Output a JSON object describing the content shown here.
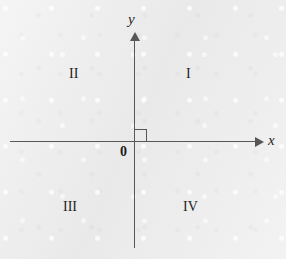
{
  "figure": {
    "type": "cartesian-coordinate-plane",
    "background_color": "#ececec",
    "stroke_color": "#575757",
    "text_color": "#1f1f1f"
  },
  "axes": {
    "x": {
      "label": "x",
      "arrow_direction": "right",
      "position_y": 141
    },
    "y": {
      "label": "y",
      "arrow_direction": "up",
      "position_x": 134
    }
  },
  "origin": {
    "label": "0",
    "x": 135,
    "y": 141
  },
  "right_angle_marker": {
    "name": "right-angle-square",
    "quadrant": "I",
    "size": 12
  },
  "quadrants": [
    {
      "id": "i",
      "label": "I",
      "name": "quadrant-i"
    },
    {
      "id": "ii",
      "label": "II",
      "name": "quadrant-ii"
    },
    {
      "id": "iii",
      "label": "III",
      "name": "quadrant-iii"
    },
    {
      "id": "iv",
      "label": "IV",
      "name": "quadrant-iv"
    }
  ],
  "chart_data": {
    "type": "scatter",
    "title": "",
    "subtitle": "",
    "xlabel": "x",
    "ylabel": "y",
    "xlim": [
      -1,
      1
    ],
    "ylim": [
      -1,
      1
    ],
    "grid": false,
    "legend": null,
    "x": [],
    "y": [],
    "series": [],
    "annotations": [
      {
        "text": "I",
        "x": 0.45,
        "y": 0.55
      },
      {
        "text": "II",
        "x": -0.48,
        "y": 0.55
      },
      {
        "text": "III",
        "x": -0.52,
        "y": -0.52
      },
      {
        "text": "IV",
        "x": 0.42,
        "y": -0.52
      },
      {
        "text": "0",
        "x": -0.09,
        "y": -0.07
      }
    ]
  }
}
